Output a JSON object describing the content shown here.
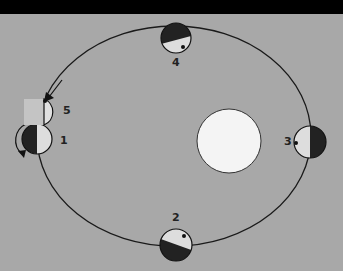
{
  "diagram": {
    "background": "#a8a8a8",
    "orbit_color": "#1a1a1a",
    "sun": {
      "label": "",
      "fill": "#f4f4f4"
    },
    "positions": [
      {
        "id": "1",
        "label": "1"
      },
      {
        "id": "2",
        "label": "2"
      },
      {
        "id": "3",
        "label": "3"
      },
      {
        "id": "4",
        "label": "4"
      },
      {
        "id": "5",
        "label": "5"
      }
    ]
  }
}
